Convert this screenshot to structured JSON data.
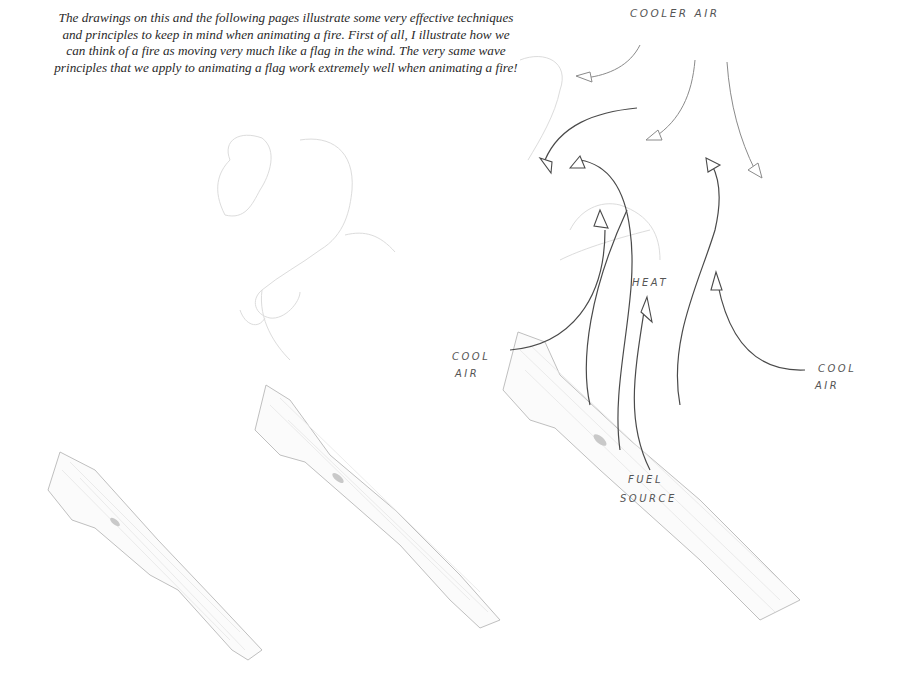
{
  "caption": {
    "text": "The drawings on this and the following pages illustrate some very effective techniques and principles to keep in mind when animating a fire. First of all, I illustrate how we can think of a fire as moving very much like a flag in the wind. The very same wave principles that we apply to animating a flag work extremely well when animating a fire!"
  },
  "diagram": {
    "panels": [
      {
        "id": "sketch-1",
        "content": "log only"
      },
      {
        "id": "sketch-2",
        "content": "log with faint flag-like flame outline"
      },
      {
        "id": "sketch-3",
        "content": "log with airflow and heat arrows"
      }
    ],
    "labels": {
      "cooler_air": "COOLER AIR",
      "cool_air_left_line1": "COOL",
      "cool_air_left_line2": "AIR",
      "cool_air_right_line1": "COOL",
      "cool_air_right_line2": "AIR",
      "heat": "HEAT",
      "fuel_source_line1": "FUEL",
      "fuel_source_line2": "SOURCE"
    }
  }
}
